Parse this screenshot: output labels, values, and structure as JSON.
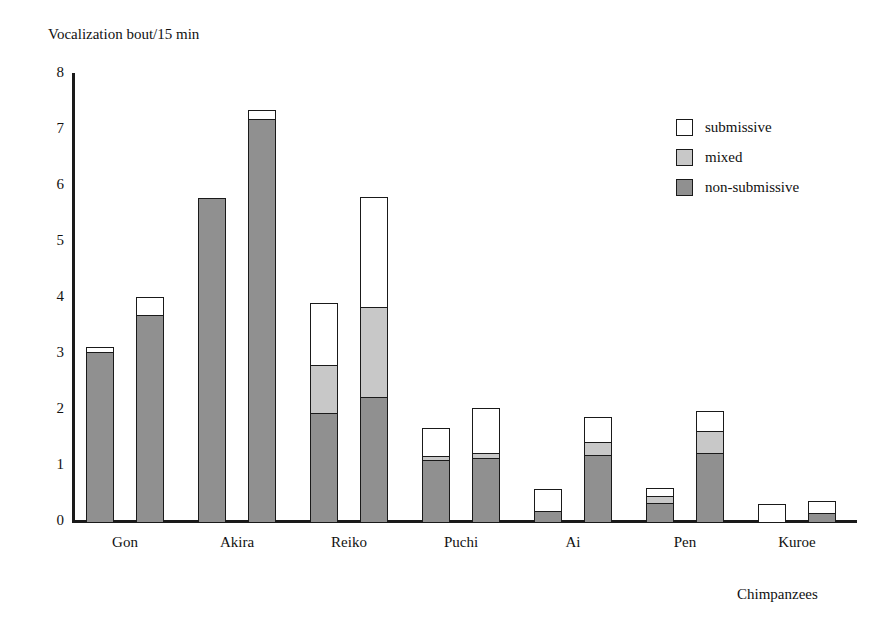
{
  "chart_data": {
    "type": "bar",
    "title": "",
    "ylabel": "Vocalization bout/15 min",
    "xlabel": "Chimpanzees",
    "ylim": [
      0,
      8
    ],
    "yticks": [
      8,
      7,
      6,
      5,
      4,
      3,
      2,
      1,
      0
    ],
    "grid": false,
    "stacked": true,
    "bars_per_category": 2,
    "legend_position": "top-right",
    "categories": [
      "Gon",
      "Akira",
      "Reiko",
      "Puchi",
      "Ai",
      "Pen",
      "Kuroe"
    ],
    "legend": [
      "submissive",
      "mixed",
      "non-submissive"
    ],
    "colors": {
      "submissive": "#ffffff",
      "mixed": "#c8c8c8",
      "non-submissive": "#909090",
      "outline": "#1a1a1a"
    },
    "series": [
      {
        "name": "non-submissive",
        "bar1": [
          3.05,
          5.8,
          1.95,
          1.12,
          0.2,
          0.35,
          0.0
        ],
        "bar2": [
          3.7,
          7.2,
          2.25,
          1.15,
          1.2,
          1.25,
          0.17
        ]
      },
      {
        "name": "mixed",
        "bar1": [
          0.0,
          0.0,
          0.9,
          0.1,
          0.0,
          0.15,
          0.0
        ],
        "bar2": [
          0.0,
          0.0,
          1.63,
          0.13,
          0.27,
          0.42,
          0.0
        ]
      },
      {
        "name": "submissive",
        "bar1": [
          0.12,
          0.0,
          1.12,
          0.53,
          0.43,
          0.17,
          0.33
        ],
        "bar2": [
          0.35,
          0.2,
          1.99,
          0.82,
          0.48,
          0.38,
          0.25
        ]
      }
    ],
    "totals": {
      "bar1": [
        3.17,
        5.8,
        3.97,
        1.75,
        0.63,
        0.67,
        0.33
      ],
      "bar2": [
        4.05,
        7.4,
        5.87,
        2.1,
        1.95,
        2.05,
        0.42
      ]
    }
  }
}
